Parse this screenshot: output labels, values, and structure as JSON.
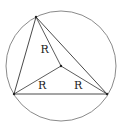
{
  "diagram": {
    "type": "geometry",
    "shapes": {
      "circle": "circumscribed-circle",
      "triangle": "inscribed-triangle",
      "center": "circumcenter"
    },
    "labels": {
      "radius_top": "R",
      "radius_left": "R",
      "radius_right": "R"
    },
    "colors": {
      "circle": "#8a8a8a",
      "lines": "#4a4a4a",
      "text": "#222222"
    }
  }
}
